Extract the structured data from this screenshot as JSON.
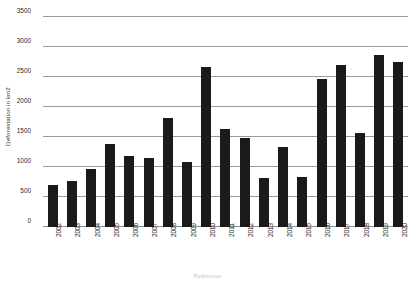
{
  "chart_data": {
    "type": "bar",
    "title": "",
    "xlabel": "Reference",
    "ylabel": "Deforestation in km2",
    "ylim": [
      0,
      3500
    ],
    "ytick_step": 500,
    "grid": true,
    "legend": "none",
    "bar_color": "#1a1a1a",
    "gridline_color": "#9a9a9a",
    "categories": [
      "2002",
      "2003",
      "2004",
      "2005",
      "2006",
      "2007",
      "2008",
      "2009",
      "2010",
      "2011",
      "2012",
      "2013",
      "2014",
      "2015",
      "2016",
      "2017",
      "2018",
      "2019",
      "2020"
    ],
    "values": [
      700,
      775,
      960,
      1380,
      1180,
      1150,
      1810,
      1080,
      2670,
      1640,
      1490,
      810,
      1340,
      835,
      2460,
      2700,
      1565,
      2870,
      2750
    ],
    "ytick_labels": [
      "0",
      "500",
      "1000",
      "1500",
      "2000",
      "2500",
      "3000",
      "3500"
    ],
    "ytick_values": [
      0,
      500,
      1000,
      1500,
      2000,
      2500,
      3000,
      3500
    ]
  }
}
